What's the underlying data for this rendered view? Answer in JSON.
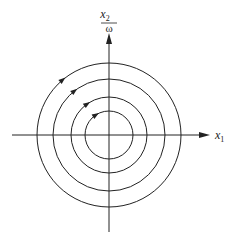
{
  "diagram": {
    "type": "phase-portrait",
    "center": {
      "x": 109,
      "y": 135
    },
    "axes": {
      "x": {
        "label_var": "x",
        "label_sub": "1"
      },
      "y": {
        "numerator_var": "x",
        "numerator_sub": "2",
        "denominator": "ω"
      }
    },
    "circles": [
      {
        "radius": 24,
        "arrow_angle_deg": 123
      },
      {
        "radius": 38,
        "arrow_angle_deg": 125
      },
      {
        "radius": 56,
        "arrow_angle_deg": 128
      },
      {
        "radius": 72,
        "arrow_angle_deg": 130
      }
    ],
    "direction": "clockwise",
    "colors": {
      "stroke": "#222222",
      "background": "#ffffff"
    }
  }
}
